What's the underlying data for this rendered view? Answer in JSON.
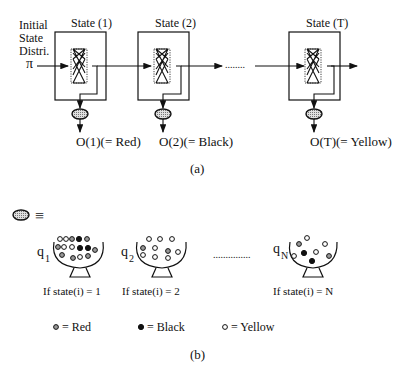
{
  "part_a": {
    "initial_label": [
      "Initial",
      "State",
      "Distri."
    ],
    "pi_symbol": "π",
    "states": [
      {
        "title": "State (1)",
        "output": "O(1)(= Red)"
      },
      {
        "title": "State (2)",
        "output": "O(2)(= Black)"
      },
      {
        "title": "State (T)",
        "output": "O(T)(= Yellow)"
      }
    ],
    "ellipsis": "........",
    "sublabel": "(a)"
  },
  "part_b": {
    "equivalence_symbol": "≡",
    "urns": [
      {
        "label": "q",
        "subscript": "1",
        "condition": "If state(i) = 1"
      },
      {
        "label": "q",
        "subscript": "2",
        "condition": "If state(i) = 2"
      },
      {
        "label": "q",
        "subscript": "N",
        "condition": "If state(i) = N"
      }
    ],
    "ellipsis": "...............",
    "legend": [
      {
        "symbol": "red-ball",
        "text": "= Red"
      },
      {
        "symbol": "black-ball",
        "text": "= Black"
      },
      {
        "symbol": "yellow-ball",
        "text": "= Yellow"
      }
    ],
    "sublabel": "(b)"
  },
  "colors": {
    "line": "#111111",
    "emission_fill": "#bdbdbd",
    "background": "#ffffff"
  }
}
